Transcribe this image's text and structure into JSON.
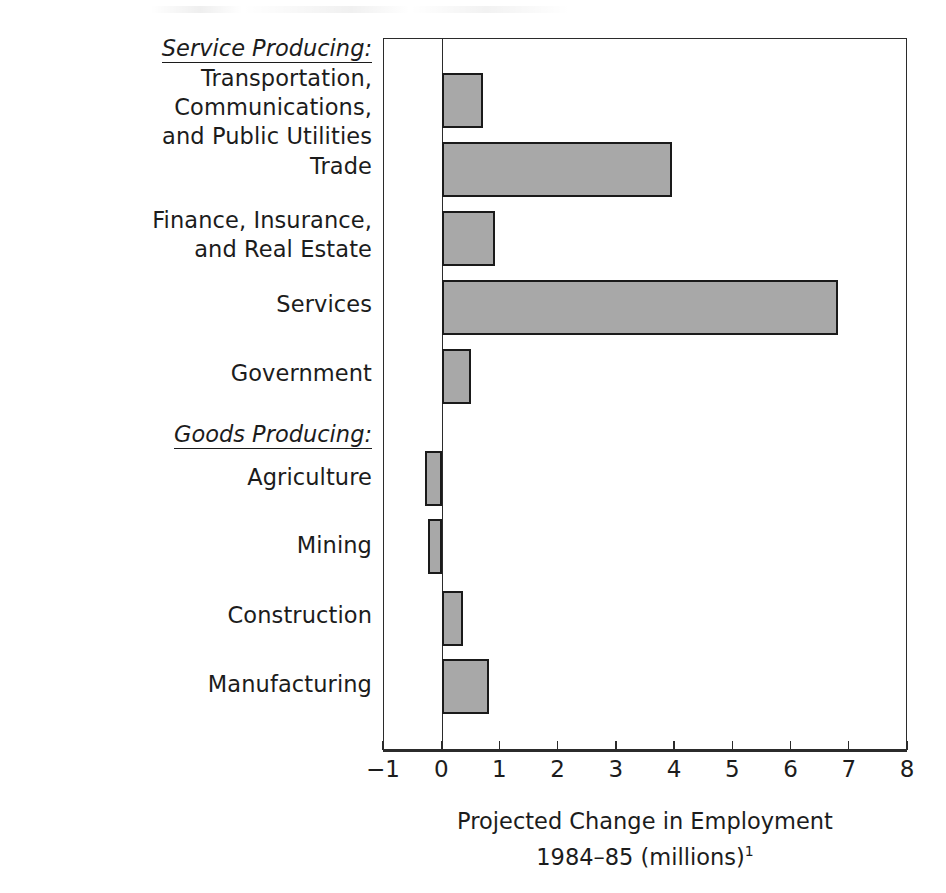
{
  "chart_data": {
    "type": "bar",
    "orientation": "horizontal",
    "title": "",
    "xlabel_line1": "Projected Change in Employment",
    "xlabel_line2": "1984–85 (millions)",
    "xlabel_footnote_marker": "1",
    "ylabel": "",
    "xlim": [
      -1,
      8
    ],
    "xticks": [
      -1,
      0,
      1,
      2,
      3,
      4,
      5,
      6,
      7,
      8
    ],
    "xticklabels": [
      "−1",
      "0",
      "1",
      "2",
      "3",
      "4",
      "5",
      "6",
      "7",
      "8"
    ],
    "grid": false,
    "legend": null,
    "bar_facecolor": "#a8a8a8",
    "bar_edgecolor": "#1a1a1a",
    "axis_color": "#2b2b2b",
    "groups": [
      {
        "name": "Service Producing:",
        "style": "italic-underline",
        "categories": [
          "Transportation, Communications,\nand Public Utilities",
          "Trade",
          "Finance, Insurance,\nand Real Estate",
          "Services",
          "Government"
        ],
        "values": [
          0.7,
          3.95,
          0.9,
          6.8,
          0.5
        ]
      },
      {
        "name": "Goods Producing:",
        "style": "italic-underline",
        "categories": [
          "Agriculture",
          "Mining",
          "Construction",
          "Manufacturing"
        ],
        "values": [
          -0.3,
          -0.25,
          0.35,
          0.8
        ]
      }
    ],
    "categories": [
      "Transportation, Communications,\nand Public Utilities",
      "Trade",
      "Finance, Insurance,\nand Real Estate",
      "Services",
      "Government",
      "Agriculture",
      "Mining",
      "Construction",
      "Manufacturing"
    ],
    "values": [
      0.7,
      3.95,
      0.9,
      6.8,
      0.5,
      -0.3,
      -0.25,
      0.35,
      0.8
    ]
  },
  "labels": {
    "group_service": "Service Producing:",
    "group_goods": "Goods Producing:",
    "cat_tcpu": "Transportation, Communications,\nand Public Utilities",
    "cat_trade": "Trade",
    "cat_fire": "Finance, Insurance,\nand Real Estate",
    "cat_services": "Services",
    "cat_government": "Government",
    "cat_agriculture": "Agriculture",
    "cat_mining": "Mining",
    "cat_construction": "Construction",
    "cat_manufacturing": "Manufacturing"
  },
  "axis": {
    "t_neg1": "−1",
    "t_0": "0",
    "t_1": "1",
    "t_2": "2",
    "t_3": "3",
    "t_4": "4",
    "t_5": "5",
    "t_6": "6",
    "t_7": "7",
    "t_8": "8"
  },
  "caption": {
    "line1": "Projected Change in Employment",
    "line2": "1984–85 (millions)",
    "footnote": "1"
  }
}
